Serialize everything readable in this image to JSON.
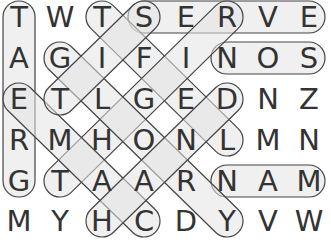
{
  "puzzle": {
    "rows": 6,
    "cols": 8,
    "grid": [
      [
        "T",
        "W",
        "T",
        "S",
        "E",
        "R",
        "V",
        "E"
      ],
      [
        "A",
        "G",
        "I",
        "F",
        "I",
        "N",
        "O",
        "S"
      ],
      [
        "E",
        "T",
        "L",
        "G",
        "E",
        "D",
        "N",
        "Z"
      ],
      [
        "R",
        "M",
        "H",
        "O",
        "N",
        "L",
        "M",
        "N"
      ],
      [
        "G",
        "T",
        "A",
        "A",
        "R",
        "N",
        "A",
        "M"
      ],
      [
        "M",
        "Y",
        "H",
        "C",
        "D",
        "Y",
        "V",
        "W"
      ]
    ],
    "found_words": [
      {
        "word": "GREAT",
        "start": [
          4,
          0
        ],
        "end": [
          0,
          0
        ]
      },
      {
        "word": "SERVE",
        "start": [
          0,
          3
        ],
        "end": [
          0,
          7
        ]
      },
      {
        "word": "SON",
        "start": [
          1,
          7
        ],
        "end": [
          1,
          5
        ]
      },
      {
        "word": "MAN",
        "start": [
          4,
          7
        ],
        "end": [
          4,
          5
        ]
      },
      {
        "word": "LEFT",
        "start": [
          3,
          5
        ],
        "end": [
          0,
          2
        ]
      },
      {
        "word": "RIGHT",
        "start": [
          0,
          5
        ],
        "end": [
          4,
          1
        ]
      },
      {
        "word": "GLORY",
        "start": [
          1,
          1
        ],
        "end": [
          5,
          5
        ]
      },
      {
        "word": "MACE",
        "start": [
          5,
          3
        ],
        "end": [
          2,
          0
        ]
      },
      {
        "word": "SIT",
        "start": [
          0,
          3
        ],
        "end": [
          2,
          1
        ]
      },
      {
        "word": "HAND",
        "start": [
          5,
          2
        ],
        "end": [
          2,
          5
        ]
      }
    ]
  },
  "colors": {
    "letter": "#333333",
    "highlight_fill": "#e3e3e3",
    "highlight_stroke": "#444444",
    "background": "#ffffff"
  }
}
